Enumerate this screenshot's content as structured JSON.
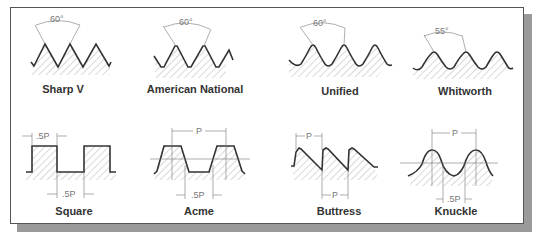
{
  "figure": {
    "colors": {
      "frame": "#555555",
      "shadow": "#9a9a9a",
      "profile": "#333333",
      "hatch": "#999999",
      "dimension": "#777777"
    }
  },
  "thread_forms": [
    {
      "name": "Sharp V",
      "angle_label": "60°"
    },
    {
      "name": "American National",
      "angle_label": "60°"
    },
    {
      "name": "Unified",
      "angle_label": "60°"
    },
    {
      "name": "Whitworth",
      "angle_label": "55°"
    },
    {
      "name": "Square",
      "top_dim": ".5P",
      "bottom_dim": ".5P"
    },
    {
      "name": "Acme",
      "top_dim": "P",
      "bottom_dim": ".5P"
    },
    {
      "name": "Buttress",
      "top_dim": "P",
      "bottom_dim": "P"
    },
    {
      "name": "Knuckle",
      "top_dim": "P",
      "bottom_dim": ".5P"
    }
  ]
}
